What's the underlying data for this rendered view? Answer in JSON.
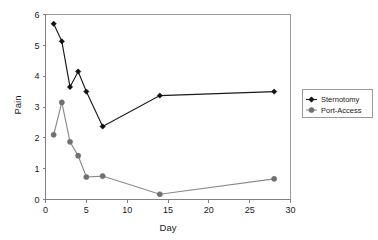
{
  "chart_data": {
    "type": "line",
    "title": "",
    "xlabel": "Day",
    "ylabel": "Pain",
    "xlim": [
      0,
      30
    ],
    "ylim": [
      0,
      6
    ],
    "xticks": [
      0,
      5,
      10,
      15,
      20,
      25,
      30
    ],
    "xtick_labels": [
      "0",
      "5",
      "10",
      "15",
      "20",
      "25",
      "30"
    ],
    "yticks": [
      0,
      1,
      2,
      3,
      4,
      5,
      6
    ],
    "ytick_labels": [
      "0",
      "1",
      "2",
      "3",
      "4",
      "5",
      "6"
    ],
    "grid": false,
    "legend_position": "right",
    "x": [
      1,
      2,
      3,
      4,
      5,
      7,
      14,
      28
    ],
    "series": [
      {
        "name": "Sternotomy",
        "marker": "diamond",
        "color": "#1a1a1a",
        "values": [
          5.7,
          5.13,
          3.65,
          4.15,
          3.5,
          2.37,
          3.37,
          3.5
        ]
      },
      {
        "name": "Port-Access",
        "marker": "circle",
        "color": "#8a8a8a",
        "values": [
          2.1,
          3.15,
          1.87,
          1.42,
          0.73,
          0.76,
          0.17,
          0.67
        ]
      }
    ]
  },
  "legend": {
    "entries": [
      {
        "label": "Sternotomy"
      },
      {
        "label": "Port-Access"
      }
    ]
  },
  "axes": {
    "x_title": "Day",
    "y_title": "Pain"
  }
}
